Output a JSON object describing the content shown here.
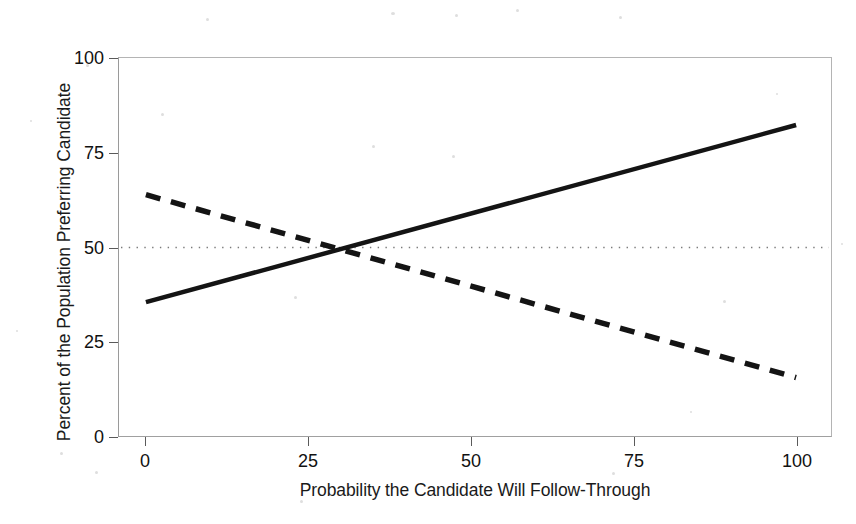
{
  "chart_data": {
    "type": "line",
    "title": "",
    "xlabel": "Probability the Candidate Will Follow-Through",
    "ylabel": "Percent of the Population Preferring Candidate",
    "xlim": [
      0,
      100
    ],
    "ylim": [
      0,
      100
    ],
    "xticks": [
      0,
      25,
      50,
      75,
      100
    ],
    "yticks": [
      0,
      25,
      50,
      75,
      100
    ],
    "xtick_labels": [
      "0",
      "25",
      "50",
      "75",
      "100"
    ],
    "ytick_labels": [
      "0",
      "25",
      "50",
      "75",
      "100"
    ],
    "grid": false,
    "legend": "none",
    "reference_lines": [
      {
        "name": "fifty-percent-reference",
        "orientation": "horizontal",
        "value": 50,
        "style": "dotted",
        "color": "#7a7a7a"
      }
    ],
    "series": [
      {
        "name": "Increasing preference (solid)",
        "style": "solid",
        "color": "#141414",
        "width": 4.5,
        "x": [
          0,
          100
        ],
        "values": [
          35.5,
          82.5
        ]
      },
      {
        "name": "Decreasing preference (dashed)",
        "style": "dashed",
        "color": "#141414",
        "width": 5.5,
        "x": [
          0,
          100
        ],
        "values": [
          64.0,
          15.5
        ]
      }
    ],
    "annotations": [
      {
        "name": "crossover-point",
        "x": 30,
        "y": 50,
        "label": ""
      }
    ]
  },
  "figure": {
    "background_color": "#ffffff",
    "axis_color": "#9a9a9a",
    "tick_color": "#5a5a5a",
    "text_color": "#111111"
  }
}
